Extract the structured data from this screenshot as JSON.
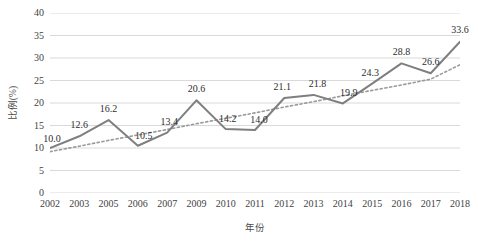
{
  "chart_data": {
    "type": "line",
    "title": "",
    "xlabel": "年份",
    "ylabel": "比例(%)",
    "categories": [
      "2002",
      "2003",
      "2005",
      "2006",
      "2007",
      "2009",
      "2010",
      "2011",
      "2012",
      "2013",
      "2014",
      "2015",
      "2016",
      "2017",
      "2018"
    ],
    "series": [
      {
        "name": "比例(%)",
        "style": "solid",
        "color": "#7f7f7f",
        "values": [
          10.0,
          12.6,
          16.2,
          10.5,
          13.4,
          20.6,
          14.2,
          14.0,
          21.1,
          21.8,
          19.9,
          24.3,
          28.8,
          26.6,
          33.6
        ],
        "labels": [
          "10.0",
          "12.6",
          "16.2",
          "10.5",
          "13.4",
          "20.6",
          "14.2",
          "14.0",
          "21.1",
          "21.8",
          "19.9",
          "24.3",
          "28.8",
          "26.6",
          "33.6"
        ]
      },
      {
        "name": "趋势线",
        "style": "dotted",
        "color": "#9a9a9a",
        "values": [
          9.2,
          10.4,
          11.7,
          12.9,
          14.1,
          15.4,
          16.6,
          17.8,
          19.1,
          20.3,
          21.6,
          22.8,
          24.0,
          25.3,
          28.5
        ]
      }
    ],
    "ylim": [
      0,
      40
    ],
    "ytick_step": 5,
    "yticks": [
      "0",
      "5",
      "10",
      "15",
      "20",
      "25",
      "30",
      "35",
      "40"
    ],
    "grid": true,
    "grid_color": "#d9d9d9",
    "legend": "none",
    "background": "#ffffff"
  }
}
